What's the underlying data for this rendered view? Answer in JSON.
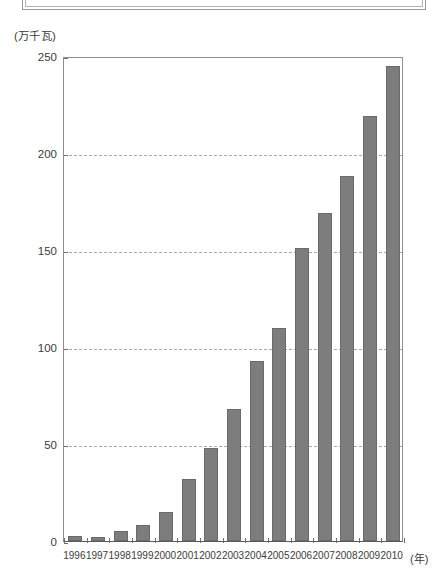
{
  "decor": {
    "top_frame_name": "cut-off-frame"
  },
  "chart_data": {
    "type": "bar",
    "title": "",
    "subtitle": "",
    "xlabel": "(年)",
    "ylabel": "(万千瓦)",
    "categories": [
      "1996",
      "1997",
      "1998",
      "1999",
      "2000",
      "2001",
      "2002",
      "2003",
      "2004",
      "2005",
      "2006",
      "2007",
      "2008",
      "2009",
      "2010"
    ],
    "values": [
      2.5,
      2,
      5,
      8,
      15,
      32,
      48,
      68,
      93,
      110,
      151,
      169,
      188,
      219,
      245
    ],
    "series": [
      {
        "name": "装机容量",
        "values": [
          2.5,
          2,
          5,
          8,
          15,
          32,
          48,
          68,
          93,
          110,
          151,
          169,
          188,
          219,
          245
        ]
      }
    ],
    "ylim": [
      0,
      250
    ],
    "yticks": [
      0,
      50,
      100,
      150,
      200,
      250
    ],
    "ytick_labels": [
      "0",
      "50",
      "100",
      "150",
      "200",
      "250"
    ],
    "grid": true,
    "grid_style": "dashed",
    "grid_axis": "y",
    "legend": false,
    "legend_position": "none",
    "bar_color": "#7d7d7d",
    "bar_edge_color": "#6a6a6a",
    "axis_color": "#8e8e8e",
    "gridline_color": "#a9a9a9",
    "background": "#ffffff"
  }
}
